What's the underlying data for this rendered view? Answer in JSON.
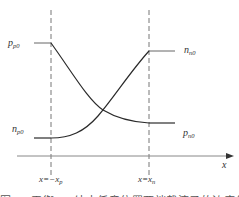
{
  "diagram": {
    "type": "carrier-concentration-profile",
    "x_axis": {
      "label": "x"
    },
    "boundaries": [
      {
        "label": "x=−x",
        "sub": "p"
      },
      {
        "label": "x=x",
        "sub": "n"
      }
    ],
    "labels": {
      "p_p0": {
        "main": "p",
        "sub": "p0"
      },
      "n_p0": {
        "main": "n",
        "sub": "p0"
      },
      "n_n0": {
        "main": "n",
        "sub": "n0"
      },
      "p_n0": {
        "main": "p",
        "sub": "n0"
      }
    },
    "curves": [
      {
        "name": "hole-concentration",
        "from": "p_p0",
        "to": "p_n0",
        "shape": "decreasing"
      },
      {
        "name": "electron-concentration",
        "from": "n_p0",
        "to": "n_n0",
        "shape": "increasing"
      }
    ],
    "caption_fragment": "图 ... 平衡 ... 结中任意位置两端载流子的浓度分布"
  },
  "colors": {
    "line": "#2a2a2a",
    "dash": "#777777",
    "axis": "#888888",
    "text": "#333333"
  }
}
